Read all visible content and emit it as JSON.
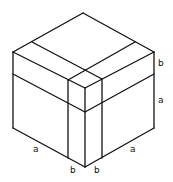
{
  "diagram": {
    "stroke_color": "#111111",
    "background": "#ffffff",
    "labels": {
      "right_top_b": "b",
      "right_a": "a",
      "left_bottom_a": "a",
      "bottom_left_b": "b",
      "bottom_right_b": "b",
      "right_bottom_a": "a"
    },
    "lines": [
      {
        "id": "outer-top-left",
        "x1": 13,
        "y1": 52,
        "x2": 83,
        "y2": 13
      },
      {
        "id": "outer-top-right",
        "x1": 83,
        "y1": 13,
        "x2": 154,
        "y2": 52
      },
      {
        "id": "outer-left",
        "x1": 13,
        "y1": 52,
        "x2": 13,
        "y2": 128
      },
      {
        "id": "outer-right",
        "x1": 154,
        "y1": 52,
        "x2": 154,
        "y2": 128
      },
      {
        "id": "outer-bottom-left",
        "x1": 13,
        "y1": 128,
        "x2": 85,
        "y2": 167
      },
      {
        "id": "outer-bottom-right",
        "x1": 85,
        "y1": 167,
        "x2": 154,
        "y2": 128
      },
      {
        "id": "front-top-left",
        "x1": 13,
        "y1": 52,
        "x2": 85,
        "y2": 88
      },
      {
        "id": "front-top-right",
        "x1": 85,
        "y1": 88,
        "x2": 154,
        "y2": 52
      },
      {
        "id": "front-vertical",
        "x1": 85,
        "y1": 88,
        "x2": 85,
        "y2": 167
      },
      {
        "id": "band-left",
        "x1": 13,
        "y1": 74,
        "x2": 85,
        "y2": 112
      },
      {
        "id": "band-right",
        "x1": 85,
        "y1": 112,
        "x2": 154,
        "y2": 74
      },
      {
        "id": "vert-left",
        "x1": 68,
        "y1": 80,
        "x2": 68,
        "y2": 158
      },
      {
        "id": "vert-right",
        "x1": 102,
        "y1": 79,
        "x2": 102,
        "y2": 158
      },
      {
        "id": "top-line-a",
        "x1": 32,
        "y1": 42,
        "x2": 102,
        "y2": 79
      },
      {
        "id": "top-line-b",
        "x1": 135,
        "y1": 42,
        "x2": 68,
        "y2": 80
      }
    ]
  }
}
